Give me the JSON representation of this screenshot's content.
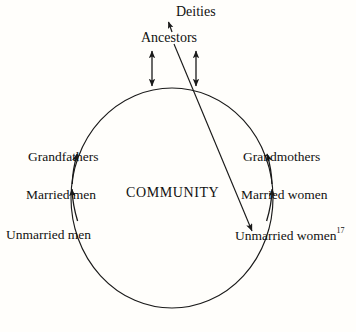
{
  "diagram": {
    "title_center": "COMMUNITY",
    "top_labels": {
      "deities": "Deities",
      "ancestors": "Ancestors"
    },
    "left_stages": [
      {
        "label": "Grandfathers"
      },
      {
        "label": "Married men"
      },
      {
        "label": "Unmarried men"
      }
    ],
    "right_stages": [
      {
        "label": "Grandmothers"
      },
      {
        "label": "Married women"
      },
      {
        "label": "Unmarried women"
      }
    ],
    "footnote_marker": "17",
    "colors": {
      "ink": "#111111",
      "background": "#fffefb",
      "stroke": "#1a1a1a"
    },
    "icons": {
      "circle": "community-circle-icon",
      "arrow_up": "arrow-up-icon",
      "arrow_double": "double-headed-arrow-icon",
      "arrow_diagonal": "diagonal-arrow-icon"
    }
  }
}
